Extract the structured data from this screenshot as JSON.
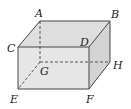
{
  "figure": {
    "type": "rectangular-prism",
    "colors": {
      "edge": "#444444",
      "top_face": "#dedede",
      "front_face": "#e4e4e4",
      "side_face": "#d6d6d6",
      "background": "#ffffff"
    },
    "vertices": {
      "A": {
        "label": "A",
        "x": 40,
        "y": 21,
        "lx": 35,
        "ly": 17
      },
      "B": {
        "label": "B",
        "x": 110,
        "y": 21,
        "lx": 111,
        "ly": 18
      },
      "C": {
        "label": "C",
        "x": 18,
        "y": 47,
        "lx": 7,
        "ly": 52
      },
      "D": {
        "label": "D",
        "x": 89,
        "y": 47,
        "lx": 80,
        "ly": 46
      },
      "E": {
        "label": "E",
        "x": 18,
        "y": 89,
        "lx": 10,
        "ly": 103
      },
      "F": {
        "label": "F",
        "x": 89,
        "y": 89,
        "lx": 86,
        "ly": 103
      },
      "G": {
        "label": "G",
        "x": 40,
        "y": 62,
        "lx": 40,
        "ly": 75
      },
      "H": {
        "label": "H",
        "x": 110,
        "y": 62,
        "lx": 113,
        "ly": 69
      }
    },
    "solid_edges": [
      "AB",
      "AC",
      "BD",
      "CD",
      "CE",
      "DF",
      "EF",
      "BH",
      "HF"
    ],
    "hidden_edges": [
      "AG",
      "GH",
      "GE"
    ]
  }
}
